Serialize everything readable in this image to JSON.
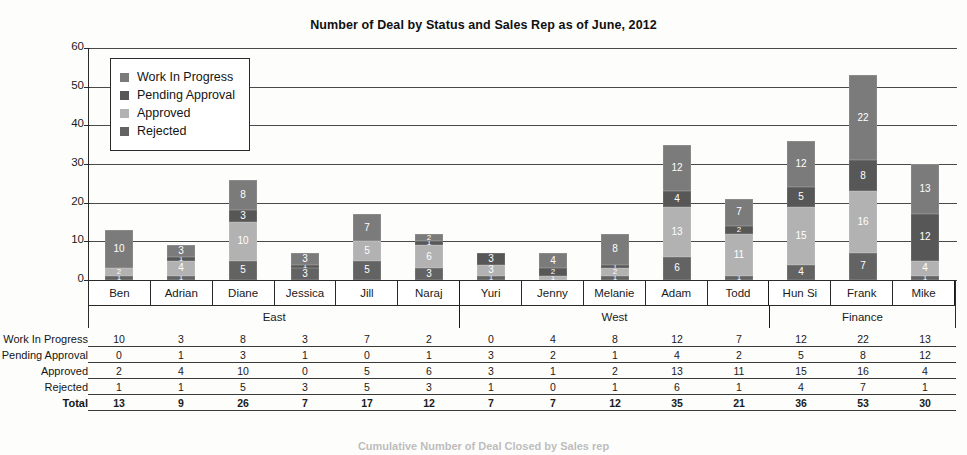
{
  "chart_data": {
    "type": "bar",
    "subtype": "stacked-column",
    "title": "Number of Deal by Status and Sales Rep as of June, 2012",
    "xlabel": "",
    "ylabel": "",
    "ylim": [
      0,
      60
    ],
    "yticks": [
      0,
      10,
      20,
      30,
      40,
      50,
      60
    ],
    "grid": true,
    "legend_position": "inside-top-left",
    "categories": [
      "Ben",
      "Adrian",
      "Diane",
      "Jessica",
      "Jill",
      "Naraj",
      "Yuri",
      "Jenny",
      "Melanie",
      "Adam",
      "Todd",
      "Hun Si",
      "Frank",
      "Mike"
    ],
    "groups": [
      {
        "name": "East",
        "span": 6
      },
      {
        "name": "West",
        "span": 5
      },
      {
        "name": "Finance",
        "span": 3
      }
    ],
    "series": [
      {
        "name": "Work In Progress",
        "color": "#7b7b7b",
        "values": [
          10,
          3,
          8,
          3,
          7,
          2,
          0,
          4,
          8,
          12,
          7,
          12,
          22,
          13
        ]
      },
      {
        "name": "Pending Approval",
        "color": "#575757",
        "values": [
          0,
          1,
          3,
          1,
          0,
          1,
          3,
          2,
          1,
          4,
          2,
          5,
          8,
          12
        ]
      },
      {
        "name": "Approved",
        "color": "#b2b2b2",
        "values": [
          2,
          4,
          10,
          0,
          5,
          6,
          3,
          1,
          2,
          13,
          11,
          15,
          16,
          4
        ]
      },
      {
        "name": "Rejected",
        "color": "#636363",
        "values": [
          1,
          1,
          5,
          3,
          5,
          3,
          1,
          0,
          1,
          6,
          1,
          4,
          7,
          1
        ]
      }
    ],
    "stack_order_top_to_bottom": [
      "Work In Progress",
      "Pending Approval",
      "Approved",
      "Rejected"
    ],
    "totals": [
      13,
      9,
      26,
      7,
      17,
      12,
      7,
      7,
      12,
      35,
      21,
      36,
      53,
      30
    ],
    "total_label": "Total"
  },
  "legend": {
    "items": [
      {
        "label": "Work In Progress",
        "swatch": "legend-swatch-work-in-progress"
      },
      {
        "label": "Pending Approval",
        "swatch": "legend-swatch-pending-approval"
      },
      {
        "label": "Approved",
        "swatch": "legend-swatch-approved"
      },
      {
        "label": "Rejected",
        "swatch": "legend-swatch-rejected"
      }
    ]
  },
  "footer": {
    "caption": "Cumulative Number of Deal Closed by Sales rep"
  }
}
